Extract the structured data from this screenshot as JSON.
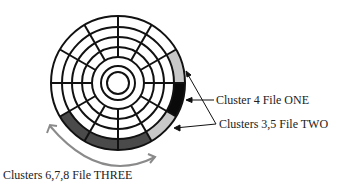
{
  "disk": {
    "center": [
      118,
      83
    ],
    "radii": [
      67,
      56,
      46,
      36,
      26,
      17,
      11
    ],
    "sectors": 12,
    "colors": {
      "file_one": "#0a0a0a",
      "file_two": "#c8c8c8",
      "file_three": "#4a4a4a",
      "line": "#111111",
      "arc_arrow": "#8a8a8a"
    }
  },
  "labels": {
    "cluster4": "Cluster 4   File ONE",
    "clusters35": "Clusters 3,5   File TWO",
    "clusters678": "Clusters 6,7,8   File THREE"
  }
}
